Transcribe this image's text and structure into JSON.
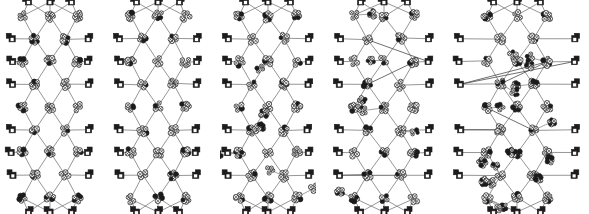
{
  "figure": {
    "title": "",
    "caption": "",
    "background_color": "#ffffff",
    "width": 589,
    "height": 214,
    "panel_count": 5
  },
  "panels": [
    {
      "id": "panel-1",
      "label": "",
      "x": 4,
      "width": 92,
      "shortcuts": 0,
      "density": "sparse",
      "seed": 11
    },
    {
      "id": "panel-2",
      "label": "",
      "x": 112,
      "width": 92,
      "shortcuts": 0,
      "density": "sparse",
      "seed": 23
    },
    {
      "id": "panel-3",
      "label": "",
      "x": 220,
      "width": 96,
      "shortcuts": 2,
      "density": "medium",
      "seed": 37
    },
    {
      "id": "panel-4",
      "label": "",
      "x": 332,
      "width": 104,
      "shortcuts": 10,
      "density": "medium",
      "seed": 53
    },
    {
      "id": "panel-5",
      "label": "",
      "x": 452,
      "width": 130,
      "shortcuts": 18,
      "density": "dense",
      "seed": 71
    }
  ],
  "style": {
    "edge_color": "#8a8a8a",
    "edge_color_dark": "#4a4a4a",
    "node_light_fill": "#f2f2f2",
    "node_light_stroke": "#1a1a1a",
    "node_dark_fill": "#1c1c1c",
    "node_mid_fill": "#6e6e6e",
    "node_radius": 4.6,
    "border_node_size": 6.2
  },
  "chart_data": {
    "type": "diagram",
    "title": "",
    "xlabel": "",
    "ylabel": "",
    "legend": [],
    "rows": 9,
    "columns_per_row": [
      3,
      2,
      3,
      2,
      3,
      2,
      3,
      2,
      3
    ]
  }
}
